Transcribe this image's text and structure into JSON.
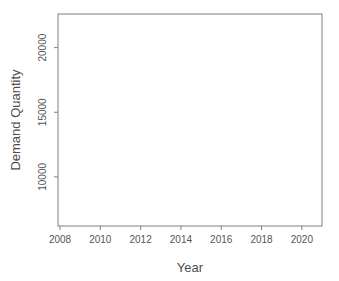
{
  "chart_data": {
    "type": "line",
    "title": "",
    "xlabel": "Year",
    "ylabel": "Demand Quantity",
    "grid": false,
    "legend": null,
    "xlim": [
      2007.9,
      2021.0
    ],
    "ylim": [
      6200,
      22600
    ],
    "xticks": [
      2008,
      2010,
      2012,
      2014,
      2016,
      2018,
      2020
    ],
    "xtick_labels": [
      "2008",
      "2010",
      "2012",
      "2014",
      "2016",
      "2018",
      "2020"
    ],
    "yticks": [
      10000,
      15000,
      20000
    ],
    "ytick_labels": [
      "10000",
      "15000",
      "20000"
    ],
    "colors": {
      "history_line": "#3a3a3a",
      "forecast_line": "#2b2b2b",
      "interval_inner": "#9a9a9a",
      "interval_outer": "#cccccc",
      "axis": "#808080",
      "text": "#4d4d4d",
      "background": "#ffffff"
    },
    "forecast_start_x": 2017.55,
    "series": [
      {
        "name": "Historical Demand",
        "kind": "observed",
        "x": [
          2008.04,
          2008.13,
          2008.21,
          2008.29,
          2008.38,
          2008.46,
          2008.54,
          2008.63,
          2008.71,
          2008.79,
          2008.88,
          2008.96,
          2009.04,
          2009.13,
          2009.21,
          2009.29,
          2009.38,
          2009.46,
          2009.54,
          2009.63,
          2009.71,
          2009.79,
          2009.88,
          2009.96,
          2010.04,
          2010.13,
          2010.21,
          2010.29,
          2010.38,
          2010.46,
          2010.54,
          2010.63,
          2010.71,
          2010.79,
          2010.88,
          2010.96,
          2011.04,
          2011.13,
          2011.21,
          2011.29,
          2011.38,
          2011.46,
          2011.54,
          2011.63,
          2011.71,
          2011.79,
          2011.88,
          2011.96,
          2012.04,
          2012.13,
          2012.21,
          2012.29,
          2012.38,
          2012.46,
          2012.54,
          2012.63,
          2012.71,
          2012.79,
          2012.88,
          2012.96,
          2013.04,
          2013.13,
          2013.21,
          2013.29,
          2013.38,
          2013.46,
          2013.54,
          2013.63,
          2013.71,
          2013.79,
          2013.88,
          2013.96,
          2014.04,
          2014.13,
          2014.21,
          2014.29,
          2014.38,
          2014.46,
          2014.54,
          2014.63,
          2014.71,
          2014.79,
          2014.88,
          2014.96,
          2015.04,
          2015.13,
          2015.21,
          2015.29,
          2015.38,
          2015.46,
          2015.54,
          2015.63,
          2015.71,
          2015.79,
          2015.88,
          2015.96,
          2016.04,
          2016.13,
          2016.21,
          2016.29,
          2016.38,
          2016.46,
          2016.54,
          2016.63,
          2016.71,
          2016.79,
          2016.88,
          2016.96,
          2017.04,
          2017.13,
          2017.21,
          2017.29,
          2017.38,
          2017.46,
          2017.55
        ],
        "y": [
          6750,
          7050,
          6600,
          7250,
          7550,
          7400,
          8050,
          8250,
          8100,
          8600,
          8450,
          8900,
          9050,
          8750,
          9350,
          9600,
          9300,
          10050,
          9500,
          9200,
          9700,
          9450,
          9800,
          9550,
          9900,
          9350,
          9700,
          9250,
          9600,
          9150,
          9500,
          9050,
          9450,
          8900,
          9350,
          9000,
          9500,
          9250,
          9850,
          9600,
          10200,
          9950,
          10500,
          10150,
          10750,
          10400,
          11050,
          10700,
          11200,
          10850,
          11400,
          11000,
          11500,
          11150,
          11600,
          11250,
          11650,
          11300,
          11700,
          10500,
          11350,
          11000,
          11450,
          11100,
          11550,
          11250,
          12800,
          11900,
          12400,
          12000,
          12650,
          11450,
          12100,
          11750,
          12550,
          12150,
          12900,
          12400,
          13050,
          12500,
          12850,
          12300,
          12700,
          11600,
          12950,
          12600,
          13500,
          13100,
          14050,
          13500,
          14950,
          13900,
          13500,
          13950,
          13300,
          12950,
          13650,
          13200,
          13550,
          13050,
          13400,
          12950,
          13300,
          12800,
          11750,
          10350,
          12600,
          12900,
          13200,
          12800,
          13350,
          12950,
          13500,
          13100,
          13700
        ]
      },
      {
        "name": "Forecast Mean",
        "kind": "forecast",
        "x": [
          2017.55,
          2017.63,
          2017.71,
          2017.79,
          2017.88,
          2017.96,
          2018.04,
          2018.13,
          2018.21,
          2018.29,
          2018.38,
          2018.46,
          2018.54,
          2018.63,
          2018.71,
          2018.79,
          2018.88,
          2018.96,
          2019.04,
          2019.13,
          2019.21,
          2019.29,
          2019.38,
          2019.46,
          2019.54,
          2019.63,
          2019.71,
          2019.79,
          2019.88,
          2019.96,
          2020.04,
          2020.13,
          2020.21,
          2020.29,
          2020.38,
          2020.46,
          2020.54,
          2020.63,
          2020.71,
          2020.79,
          2020.88
        ],
        "y": [
          13700,
          13500,
          14000,
          13750,
          14250,
          13950,
          14450,
          14150,
          14700,
          14350,
          14900,
          14500,
          15200,
          14750,
          15050,
          14650,
          15100,
          14800,
          15300,
          14950,
          15500,
          15150,
          15700,
          15300,
          15950,
          15500,
          16050,
          15600,
          15900,
          15500,
          15850,
          15500,
          16100,
          15750,
          16350,
          15950,
          16600,
          16250,
          16850,
          16550,
          17200
        ]
      }
    ],
    "intervals": [
      {
        "name": "95% prediction interval",
        "level": 95,
        "x": [
          2017.55,
          2017.79,
          2017.96,
          2018.21,
          2018.46,
          2018.71,
          2018.96,
          2019.21,
          2019.46,
          2019.71,
          2019.96,
          2020.21,
          2020.46,
          2020.71,
          2020.88
        ],
        "lower": [
          13300,
          12800,
          12300,
          11900,
          11500,
          11150,
          10850,
          10550,
          10300,
          10050,
          9800,
          9600,
          9450,
          9300,
          9200
        ],
        "upper": [
          14150,
          14750,
          15250,
          15900,
          16500,
          17100,
          17700,
          18300,
          18900,
          19500,
          20100,
          20700,
          21200,
          21650,
          21900
        ]
      },
      {
        "name": "80% prediction interval",
        "level": 80,
        "x": [
          2017.55,
          2017.79,
          2017.96,
          2018.21,
          2018.46,
          2018.71,
          2018.96,
          2019.21,
          2019.46,
          2019.71,
          2019.96,
          2020.21,
          2020.46,
          2020.71,
          2020.88
        ],
        "lower": [
          13500,
          13200,
          12900,
          12600,
          12350,
          12150,
          11950,
          11800,
          11650,
          11500,
          11400,
          11300,
          11250,
          11200,
          11150
        ],
        "upper": [
          13950,
          14350,
          14700,
          15150,
          15600,
          16000,
          16450,
          16900,
          17350,
          17800,
          18250,
          18700,
          19100,
          19500,
          19750
        ]
      }
    ]
  },
  "plot_geometry": {
    "left": 58,
    "right": 322,
    "top": 14,
    "bottom": 226
  }
}
